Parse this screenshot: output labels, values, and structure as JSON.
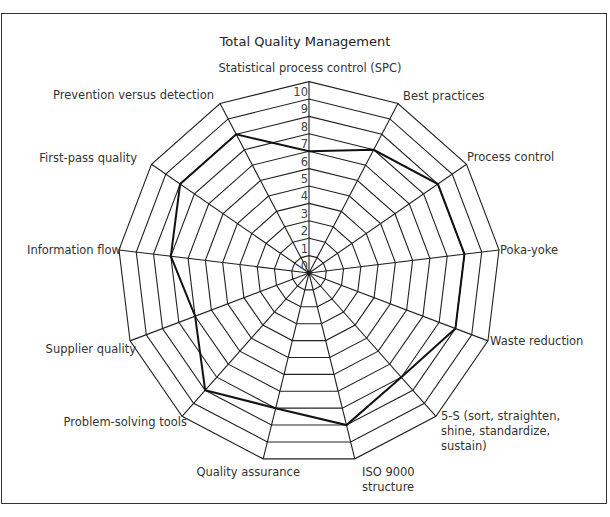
{
  "chart_data": {
    "type": "radar",
    "title": "Total Quality Management",
    "axes": [
      "Statistical process control (SPC)",
      "Best practices",
      "Process control",
      "Poka-yoke",
      "Waste reduction",
      "5-S (sort, straighten, shine, standardize, sustain)",
      "ISO 9000 structure",
      "Quality assurance",
      "Problem-solving tools",
      "Supplier quality",
      "Information flow",
      "First-pass quality",
      "Prevention versus detection"
    ],
    "series": [
      {
        "name": "Assessment",
        "values": [
          7,
          8,
          9,
          9,
          9,
          8,
          9,
          8,
          9,
          7,
          8,
          9,
          9
        ]
      }
    ],
    "radial_ticks": [
      0,
      1,
      2,
      3,
      4,
      5,
      6,
      7,
      8,
      9,
      10
    ],
    "rmax": 11,
    "grid": true,
    "legend": "none"
  },
  "labels": [
    {
      "lines": [
        "Statistical process control (SPC)"
      ],
      "x": 310,
      "y": 72,
      "anchor": "middle"
    },
    {
      "lines": [
        "Best practices"
      ],
      "x": 403,
      "y": 100,
      "anchor": "start"
    },
    {
      "lines": [
        "Process control"
      ],
      "x": 467,
      "y": 161,
      "anchor": "start"
    },
    {
      "lines": [
        "Poka-yoke"
      ],
      "x": 500,
      "y": 254,
      "anchor": "start"
    },
    {
      "lines": [
        "Waste reduction"
      ],
      "x": 490,
      "y": 345,
      "anchor": "start"
    },
    {
      "lines": [
        "5-S (sort, straighten,",
        "shine, standardize,",
        "sustain)"
      ],
      "x": 441,
      "y": 420,
      "anchor": "start"
    },
    {
      "lines": [
        "ISO 9000",
        "structure"
      ],
      "x": 362,
      "y": 476,
      "anchor": "start"
    },
    {
      "lines": [
        "Quality assurance"
      ],
      "x": 300,
      "y": 476,
      "anchor": "end"
    },
    {
      "lines": [
        "Problem-solving tools"
      ],
      "x": 187,
      "y": 426,
      "anchor": "end"
    },
    {
      "lines": [
        "Supplier quality"
      ],
      "x": 136,
      "y": 353,
      "anchor": "end"
    },
    {
      "lines": [
        "Information flow"
      ],
      "x": 121,
      "y": 254,
      "anchor": "end"
    },
    {
      "lines": [
        "First-pass quality"
      ],
      "x": 137,
      "y": 162,
      "anchor": "end"
    },
    {
      "lines": [
        "Prevention versus detection"
      ],
      "x": 214,
      "y": 99,
      "anchor": "end"
    }
  ],
  "style": {
    "grid_color": "#222222",
    "series_color": "#111111"
  }
}
